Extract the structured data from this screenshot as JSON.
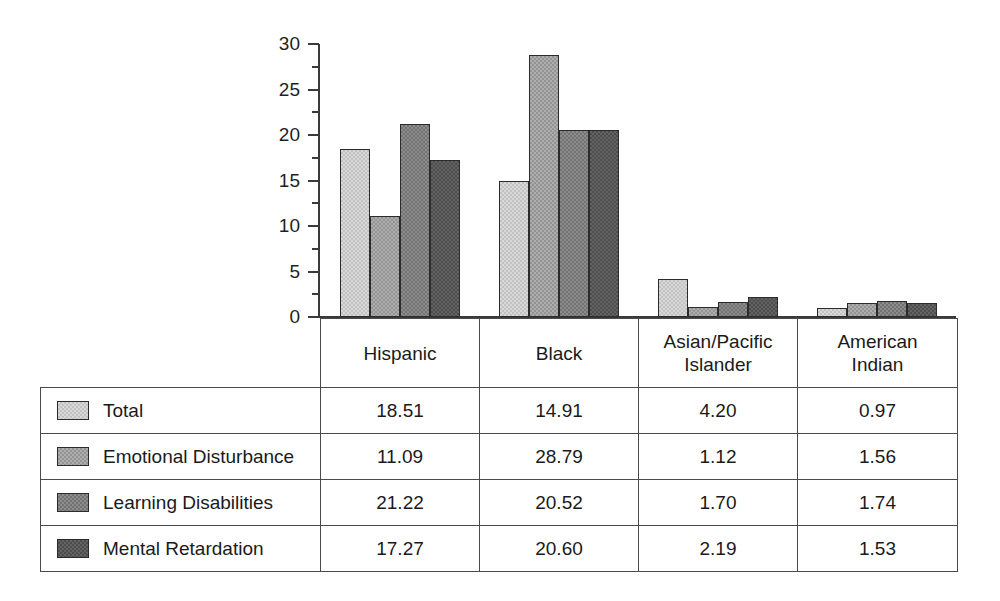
{
  "chart_data": {
    "type": "bar",
    "title": "",
    "subtitle": "",
    "xlabel": "",
    "ylabel": "",
    "ylim": [
      0,
      30
    ],
    "yticks": [
      0,
      5,
      10,
      15,
      20,
      25,
      30
    ],
    "grid": false,
    "legend_position": "table-left-column",
    "categories": [
      "Hispanic",
      "Black",
      "Asian/Pacific Islander",
      "American Indian"
    ],
    "series": [
      {
        "name": "Total",
        "color": "#d8d8d8",
        "values": [
          18.51,
          14.91,
          4.2,
          0.97
        ]
      },
      {
        "name": "Emotional Disturbance",
        "color": "#adadad",
        "values": [
          11.09,
          28.79,
          1.12,
          1.56
        ]
      },
      {
        "name": "Learning Disabilities",
        "color": "#8c8c8c",
        "values": [
          21.22,
          20.52,
          1.7,
          1.74
        ]
      },
      {
        "name": "Mental Retardation",
        "color": "#636363",
        "values": [
          17.27,
          20.6,
          2.19,
          1.53
        ]
      }
    ]
  },
  "axis": {
    "tick_labels": [
      "30",
      "25",
      "20",
      "15",
      "10",
      "5",
      "0"
    ]
  },
  "table": {
    "category_headers": [
      {
        "line1": "Hispanic",
        "line2": ""
      },
      {
        "line1": "Black",
        "line2": ""
      },
      {
        "line1": "Asian/Pacific",
        "line2": "Islander"
      },
      {
        "line1": "American",
        "line2": "Indian"
      }
    ],
    "rows": [
      {
        "label": "Total",
        "values": [
          "18.51",
          "14.91",
          "4.20",
          "0.97"
        ]
      },
      {
        "label": "Emotional Disturbance",
        "values": [
          "11.09",
          "28.79",
          "1.12",
          "1.56"
        ]
      },
      {
        "label": "Learning Disabilities",
        "values": [
          "21.22",
          "20.52",
          "1.70",
          "1.74"
        ]
      },
      {
        "label": "Mental Retardation",
        "values": [
          "17.27",
          "20.60",
          "2.19",
          "1.53"
        ]
      }
    ]
  }
}
